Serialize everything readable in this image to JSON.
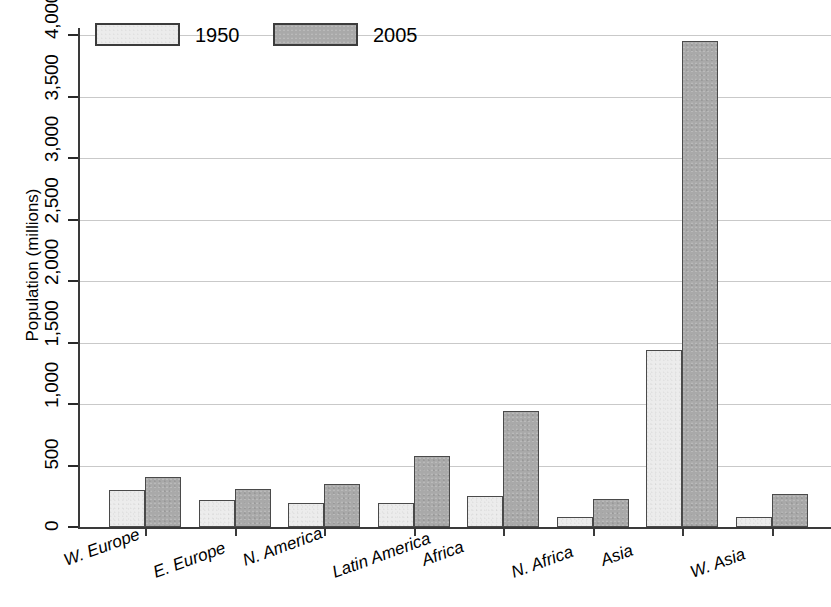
{
  "chart_data": {
    "type": "bar",
    "title": "",
    "xlabel": "",
    "ylabel": "Population (millions)",
    "ylim": [
      0,
      4000
    ],
    "yticks": [
      0,
      500,
      1000,
      1500,
      2000,
      2500,
      3000,
      3500,
      4000
    ],
    "ytick_labels": [
      "0",
      "500",
      "1,000",
      "1,500",
      "2,000",
      "2,500",
      "3,000",
      "3,500",
      "4,000"
    ],
    "grid": true,
    "legend_position": "top-left",
    "categories": [
      "W. Europe",
      "E. Europe",
      "N. America",
      "Latin America",
      "Africa",
      "N. Africa",
      "Asia",
      "W. Asia"
    ],
    "series": [
      {
        "name": "1950",
        "color": "#ececec",
        "values": [
          305,
          220,
          195,
          195,
          255,
          85,
          1440,
          80
        ]
      },
      {
        "name": "2005",
        "color": "#a9a9a9",
        "values": [
          405,
          310,
          350,
          580,
          940,
          230,
          3950,
          265
        ]
      }
    ]
  },
  "legend": {
    "entries": [
      {
        "label": "1950",
        "swatch": "legend-swatch-1950"
      },
      {
        "label": "2005",
        "swatch": "legend-swatch-2005"
      }
    ]
  },
  "axes": {
    "y_title": "Population (millions)"
  }
}
